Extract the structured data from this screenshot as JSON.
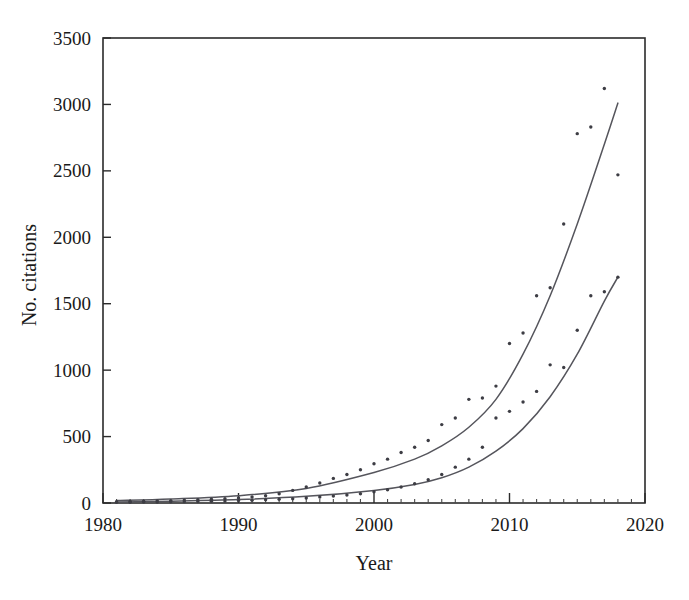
{
  "chart_data": {
    "type": "scatter",
    "title": "",
    "subtitle": "",
    "xlabel": "Year",
    "ylabel": "No. citations",
    "xlim": [
      1980,
      2020
    ],
    "ylim": [
      0,
      3500
    ],
    "xticks": [
      1980,
      1990,
      2000,
      2010,
      2020
    ],
    "xtick_labels": [
      "1980",
      "1990",
      "2000",
      "2010",
      "2020"
    ],
    "yticks": [
      0,
      500,
      1000,
      1500,
      2000,
      2500,
      3000,
      3500
    ],
    "ytick_labels": [
      "0",
      "500",
      "1000",
      "1500",
      "2000",
      "2500",
      "3000",
      "3500"
    ],
    "minor_xticks_interval": 1,
    "grid": false,
    "legend": false,
    "legend_position": "none",
    "point_color": "#3d3d44",
    "curve_color": "#55555c",
    "axis_color": "#2b2b2b",
    "background_color": "#ffffff",
    "series": [
      {
        "name": "upper-series",
        "kind": "scatter-with-fit",
        "x": [
          1981,
          1982,
          1983,
          1984,
          1985,
          1986,
          1987,
          1988,
          1989,
          1990,
          1991,
          1992,
          1993,
          1994,
          1995,
          1996,
          1997,
          1998,
          1999,
          2000,
          2001,
          2002,
          2003,
          2004,
          2005,
          2006,
          2007,
          2008,
          2009,
          2010,
          2011,
          2012,
          2013,
          2014,
          2015,
          2016,
          2017,
          2018
        ],
        "values": [
          10,
          12,
          14,
          16,
          18,
          22,
          25,
          28,
          32,
          38,
          45,
          55,
          70,
          95,
          120,
          150,
          185,
          215,
          250,
          295,
          330,
          380,
          420,
          470,
          590,
          640,
          780,
          790,
          880,
          1200,
          1280,
          1560,
          1620,
          2100,
          2780,
          2830,
          3120,
          2470
        ],
        "fit_x": [
          1981,
          1985,
          1990,
          1995,
          2000,
          2003,
          2005,
          2007,
          2009,
          2011,
          2013,
          2015,
          2017,
          2018
        ],
        "fit_values": [
          18,
          30,
          55,
          110,
          230,
          330,
          430,
          570,
          780,
          1120,
          1560,
          2100,
          2700,
          3010
        ]
      },
      {
        "name": "lower-series",
        "kind": "scatter-with-fit",
        "x": [
          1981,
          1982,
          1983,
          1984,
          1985,
          1986,
          1987,
          1988,
          1989,
          1990,
          1991,
          1992,
          1993,
          1994,
          1995,
          1996,
          1997,
          1998,
          1999,
          2000,
          2001,
          2002,
          2003,
          2004,
          2005,
          2006,
          2007,
          2008,
          2009,
          2010,
          2011,
          2012,
          2013,
          2014,
          2015,
          2016,
          2017,
          2018
        ],
        "values": [
          5,
          6,
          7,
          8,
          9,
          10,
          11,
          13,
          15,
          18,
          20,
          24,
          28,
          32,
          38,
          45,
          52,
          60,
          70,
          85,
          100,
          120,
          145,
          175,
          215,
          270,
          330,
          420,
          640,
          690,
          760,
          840,
          1040,
          1020,
          1300,
          1560,
          1590,
          1700
        ],
        "fit_x": [
          1981,
          1985,
          1990,
          1995,
          2000,
          2003,
          2005,
          2007,
          2009,
          2011,
          2013,
          2015,
          2017,
          2018
        ],
        "fit_values": [
          8,
          14,
          26,
          50,
          95,
          140,
          190,
          270,
          390,
          560,
          800,
          1120,
          1520,
          1700
        ]
      }
    ]
  }
}
